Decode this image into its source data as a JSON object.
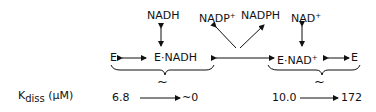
{
  "diagram": {
    "top": {
      "nadh": "NADH",
      "nadp_plus": "NADP",
      "nadph": "NADPH",
      "nad_plus": "NAD"
    },
    "row": {
      "e_left": "E",
      "e_nadh": "E·NADH",
      "e_nad_plus": "E·NAD",
      "e_right": "E"
    },
    "plus_sign": "+",
    "approx": "~",
    "kdiss": {
      "label_k": "K",
      "label_sub": "diss",
      "label_unit": "(µM)",
      "left_from": "6.8",
      "left_to": "~0",
      "right_from": "10.0",
      "right_to": "172"
    }
  }
}
